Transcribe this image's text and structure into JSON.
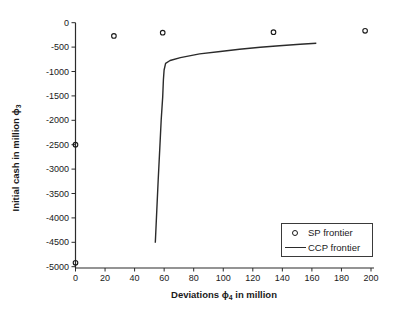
{
  "figure": {
    "background": "#ffffff",
    "axis_color": "#2b2b2b",
    "text_color": "#1a1a1a"
  },
  "chart_data": {
    "type": "scatter",
    "title": "",
    "xlabel": {
      "prefix": "Deviations ",
      "phi": "ϕ",
      "sub": "4",
      "suffix": " in million"
    },
    "ylabel": {
      "prefix": "Initial cash in million ",
      "phi": "ϕ",
      "sub": "3"
    },
    "x_axis": {
      "range": [
        0,
        200
      ],
      "ticks": [
        0,
        20,
        40,
        60,
        80,
        100,
        120,
        140,
        160,
        180,
        200
      ],
      "tick_labels": [
        "0",
        "20",
        "40",
        "60",
        "80",
        "100",
        "120",
        "140",
        "160",
        "180",
        "200"
      ]
    },
    "y_axis": {
      "range": [
        -5000,
        0
      ],
      "ticks": [
        0,
        -500,
        -1000,
        -1500,
        -2000,
        -2500,
        -3000,
        -3500,
        -4000,
        -4500,
        -5000
      ],
      "tick_labels": [
        "0",
        "-500",
        "-1000",
        "-1500",
        "-2000",
        "-2500",
        "-3000",
        "-3500",
        "-4000",
        "-4500",
        "-5000"
      ]
    },
    "grid": "off",
    "legend_position": "lower right",
    "series": [
      {
        "name": "SP frontier",
        "type": "scatter",
        "marker": "open-circle",
        "color": "#1a1a1a",
        "points": [
          [
            0,
            -4920
          ],
          [
            0,
            -2500
          ],
          [
            26,
            -270
          ],
          [
            59,
            -205
          ],
          [
            134,
            -195
          ],
          [
            196,
            -165
          ]
        ]
      },
      {
        "name": "CCP frontier",
        "type": "line",
        "color": "#2b2b2b",
        "points": [
          [
            54,
            -4510
          ],
          [
            55,
            -3840
          ],
          [
            56,
            -3220
          ],
          [
            57,
            -2610
          ],
          [
            58,
            -1990
          ],
          [
            59,
            -1520
          ],
          [
            59.5,
            -1170
          ],
          [
            60,
            -970
          ],
          [
            61,
            -835
          ],
          [
            64,
            -775
          ],
          [
            71,
            -715
          ],
          [
            84,
            -640
          ],
          [
            98,
            -590
          ],
          [
            111,
            -545
          ],
          [
            125,
            -505
          ],
          [
            138,
            -473
          ],
          [
            152,
            -442
          ],
          [
            163,
            -422
          ]
        ]
      }
    ]
  }
}
